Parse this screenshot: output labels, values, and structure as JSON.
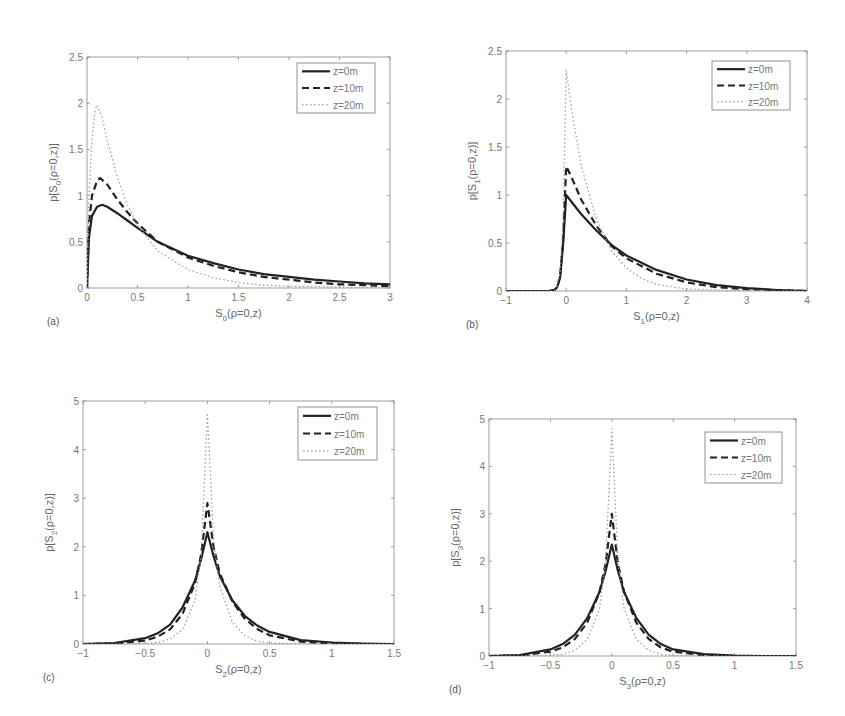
{
  "figure": {
    "legend_entries": [
      "z=0m",
      "z=10m",
      "z=20m"
    ]
  },
  "chart_data": [
    {
      "panel": "(a)",
      "type": "line",
      "xlabel": "S0(ρ=0,z)",
      "xlabel_main": "S",
      "xlabel_sub": "0",
      "xlabel_rest": "(ρ=0,z)",
      "ylabel": "p[S0(ρ=0,z)]",
      "ylabel_pre": "p[S",
      "ylabel_sub": "0",
      "ylabel_rest": "(ρ=0,z)]",
      "xlim": [
        0,
        3
      ],
      "ylim": [
        0,
        2.5
      ],
      "xticks": [
        "0",
        "0.5",
        "1",
        "1.5",
        "2",
        "2.5",
        "3"
      ],
      "xtick_values": [
        0,
        0.5,
        1,
        1.5,
        2,
        2.5,
        3
      ],
      "yticks": [
        "0",
        "0.5",
        "1",
        "1.5",
        "2",
        "2.5"
      ],
      "ytick_values": [
        0,
        0.5,
        1,
        1.5,
        2,
        2.5
      ],
      "legend_position": "upper right",
      "grid": false,
      "box": {
        "left": 87,
        "top": 57,
        "right": 390,
        "bottom": 288
      },
      "legend_box": {
        "left": 297,
        "top": 63,
        "right": 375,
        "bottom": 113
      },
      "series": [
        {
          "name": "z=0m",
          "style": "solid",
          "x": [
            0,
            0.02,
            0.05,
            0.1,
            0.15,
            0.2,
            0.3,
            0.4,
            0.5,
            0.7,
            1.0,
            1.25,
            1.5,
            1.75,
            2.0,
            2.25,
            2.5,
            2.75,
            3.0
          ],
          "y": [
            0,
            0.55,
            0.78,
            0.88,
            0.9,
            0.88,
            0.81,
            0.73,
            0.65,
            0.5,
            0.35,
            0.27,
            0.2,
            0.15,
            0.12,
            0.09,
            0.07,
            0.05,
            0.04
          ]
        },
        {
          "name": "z=10m",
          "style": "dashed",
          "x": [
            0,
            0.02,
            0.05,
            0.1,
            0.13,
            0.2,
            0.3,
            0.4,
            0.5,
            0.7,
            1.0,
            1.25,
            1.5,
            1.75,
            2.0,
            2.25,
            2.5,
            2.75,
            3.0
          ],
          "y": [
            0,
            0.7,
            1.0,
            1.16,
            1.19,
            1.12,
            0.96,
            0.82,
            0.7,
            0.5,
            0.33,
            0.24,
            0.17,
            0.12,
            0.09,
            0.06,
            0.04,
            0.03,
            0.02
          ]
        },
        {
          "name": "z=20m",
          "style": "dotted",
          "x": [
            0,
            0.02,
            0.05,
            0.08,
            0.1,
            0.15,
            0.2,
            0.3,
            0.4,
            0.5,
            0.7,
            1.0,
            1.25,
            1.5,
            1.75,
            2.0,
            2.5,
            3.0
          ],
          "y": [
            0,
            1.0,
            1.6,
            1.92,
            1.98,
            1.85,
            1.6,
            1.2,
            0.9,
            0.68,
            0.4,
            0.2,
            0.11,
            0.06,
            0.03,
            0.02,
            0.01,
            0.0
          ]
        }
      ]
    },
    {
      "panel": "(b)",
      "type": "line",
      "xlabel": "S1(ρ=0,z)",
      "xlabel_main": "S",
      "xlabel_sub": "1",
      "xlabel_rest": "(ρ=0,z)",
      "ylabel": "p[S1(ρ=0,z)]",
      "ylabel_pre": "p[S",
      "ylabel_sub": "1",
      "ylabel_rest": "(ρ=0,z)]",
      "xlim": [
        -1,
        4
      ],
      "ylim": [
        0,
        2.5
      ],
      "xticks": [
        "−1",
        "0",
        "1",
        "2",
        "3",
        "4"
      ],
      "xtick_values": [
        -1,
        0,
        1,
        2,
        3,
        4
      ],
      "yticks": [
        "0",
        "0.5",
        "1",
        "1.5",
        "2",
        "2.5"
      ],
      "ytick_values": [
        0,
        0.5,
        1,
        1.5,
        2,
        2.5
      ],
      "legend_position": "upper right",
      "grid": false,
      "box": {
        "left": 506,
        "top": 51,
        "right": 807,
        "bottom": 291
      },
      "legend_box": {
        "left": 712,
        "top": 61,
        "right": 790,
        "bottom": 110
      },
      "series": [
        {
          "name": "z=0m",
          "style": "solid",
          "x": [
            -1,
            -0.3,
            -0.2,
            -0.15,
            -0.1,
            -0.05,
            0,
            0.1,
            0.25,
            0.5,
            0.75,
            1.0,
            1.5,
            2.0,
            2.5,
            3.0,
            3.5,
            4.0
          ],
          "y": [
            0,
            0,
            0.01,
            0.04,
            0.15,
            0.5,
            1.0,
            0.92,
            0.8,
            0.63,
            0.48,
            0.37,
            0.22,
            0.12,
            0.06,
            0.03,
            0.01,
            0.0
          ]
        },
        {
          "name": "z=10m",
          "style": "dashed",
          "x": [
            -1,
            -0.3,
            -0.2,
            -0.15,
            -0.1,
            -0.05,
            0,
            0.1,
            0.25,
            0.5,
            0.75,
            1.0,
            1.5,
            2.0,
            2.5,
            3.0,
            3.5,
            4.0
          ],
          "y": [
            0,
            0,
            0.01,
            0.04,
            0.15,
            0.55,
            1.3,
            1.17,
            0.95,
            0.68,
            0.47,
            0.34,
            0.18,
            0.09,
            0.04,
            0.02,
            0.01,
            0.0
          ]
        },
        {
          "name": "z=20m",
          "style": "dotted",
          "x": [
            -1,
            -0.3,
            -0.2,
            -0.15,
            -0.1,
            -0.05,
            0,
            0.1,
            0.25,
            0.5,
            0.75,
            1.0,
            1.25,
            1.5,
            2.0,
            2.5,
            3.0,
            4.0
          ],
          "y": [
            0,
            0,
            0.01,
            0.05,
            0.2,
            0.8,
            2.3,
            1.85,
            1.3,
            0.75,
            0.42,
            0.24,
            0.13,
            0.07,
            0.02,
            0.01,
            0.0,
            0.0
          ]
        }
      ]
    },
    {
      "panel": "(c)",
      "type": "line",
      "xlabel": "S2(ρ=0,z)",
      "xlabel_main": "S",
      "xlabel_sub": "2",
      "xlabel_rest": "(ρ=0,z)",
      "ylabel": "p[S2(ρ=0,z)]",
      "ylabel_pre": "p[S",
      "ylabel_sub": "2",
      "ylabel_rest": "(ρ=0,z)]",
      "xlim": [
        -1,
        1.5
      ],
      "ylim": [
        0,
        5
      ],
      "xticks": [
        "−1",
        "−0.5",
        "0",
        "0.5",
        "1",
        "1.5"
      ],
      "xtick_values": [
        -1,
        -0.5,
        0,
        0.5,
        1,
        1.5
      ],
      "yticks": [
        "0",
        "1",
        "2",
        "3",
        "4",
        "5"
      ],
      "ytick_values": [
        0,
        1,
        2,
        3,
        4,
        5
      ],
      "legend_position": "upper right",
      "grid": false,
      "box": {
        "left": 83,
        "top": 401,
        "right": 394,
        "bottom": 644
      },
      "legend_box": {
        "left": 298,
        "top": 407,
        "right": 377,
        "bottom": 460
      },
      "series": [
        {
          "name": "z=0m",
          "style": "solid",
          "x": [
            -1,
            -0.75,
            -0.5,
            -0.4,
            -0.3,
            -0.2,
            -0.1,
            -0.05,
            0,
            0.05,
            0.1,
            0.2,
            0.3,
            0.4,
            0.5,
            0.75,
            1.0,
            1.25,
            1.5
          ],
          "y": [
            0.0,
            0.02,
            0.12,
            0.22,
            0.4,
            0.75,
            1.3,
            1.75,
            2.3,
            1.8,
            1.4,
            0.9,
            0.58,
            0.38,
            0.25,
            0.08,
            0.03,
            0.01,
            0.0
          ]
        },
        {
          "name": "z=10m",
          "style": "dashed",
          "x": [
            -1,
            -0.75,
            -0.5,
            -0.4,
            -0.3,
            -0.2,
            -0.1,
            -0.05,
            0,
            0.05,
            0.1,
            0.2,
            0.3,
            0.4,
            0.5,
            0.75,
            1.0,
            1.25,
            1.5
          ],
          "y": [
            0.0,
            0.01,
            0.07,
            0.15,
            0.3,
            0.62,
            1.25,
            1.85,
            2.9,
            2.0,
            1.45,
            0.88,
            0.52,
            0.31,
            0.18,
            0.05,
            0.01,
            0.0,
            0.0
          ]
        },
        {
          "name": "z=20m",
          "style": "dotted",
          "x": [
            -1,
            -0.75,
            -0.5,
            -0.4,
            -0.3,
            -0.2,
            -0.1,
            -0.05,
            0,
            0.05,
            0.1,
            0.2,
            0.3,
            0.4,
            0.5,
            0.75,
            1.0,
            1.5
          ],
          "y": [
            0.0,
            0.0,
            0.01,
            0.03,
            0.1,
            0.3,
            0.9,
            1.8,
            4.75,
            2.1,
            1.2,
            0.45,
            0.17,
            0.06,
            0.02,
            0.0,
            0.0,
            0.0
          ]
        }
      ]
    },
    {
      "panel": "(d)",
      "type": "line",
      "xlabel": "S3(ρ=0,z)",
      "xlabel_main": "S",
      "xlabel_sub": "3",
      "xlabel_rest": "(ρ=0,z)",
      "ylabel": "p[S3(ρ=0,z)]",
      "ylabel_pre": "p[S",
      "ylabel_sub": "3",
      "ylabel_rest": "(ρ=0,z)]",
      "xlim": [
        -1,
        1.5
      ],
      "ylim": [
        0,
        5
      ],
      "xticks": [
        "−1",
        "−0.5",
        "0",
        "0.5",
        "1",
        "1.5"
      ],
      "xtick_values": [
        -1,
        -0.5,
        0,
        0.5,
        1,
        1.5
      ],
      "yticks": [
        "0",
        "1",
        "2",
        "3",
        "4",
        "5"
      ],
      "ytick_values": [
        0,
        1,
        2,
        3,
        4,
        5
      ],
      "legend_position": "upper right",
      "grid": false,
      "box": {
        "left": 489,
        "top": 419,
        "right": 796,
        "bottom": 656
      },
      "legend_box": {
        "left": 705,
        "top": 432,
        "right": 782,
        "bottom": 483
      },
      "series": [
        {
          "name": "z=0m",
          "style": "solid",
          "x": [
            -1,
            -0.75,
            -0.5,
            -0.4,
            -0.3,
            -0.2,
            -0.1,
            -0.05,
            0,
            0.05,
            0.1,
            0.2,
            0.3,
            0.4,
            0.5,
            0.75,
            1.0,
            1.25,
            1.5
          ],
          "y": [
            0.0,
            0.02,
            0.14,
            0.25,
            0.45,
            0.8,
            1.35,
            1.8,
            2.35,
            1.8,
            1.35,
            0.8,
            0.45,
            0.25,
            0.14,
            0.04,
            0.01,
            0.0,
            0.0
          ]
        },
        {
          "name": "z=10m",
          "style": "dashed",
          "x": [
            -1,
            -0.75,
            -0.5,
            -0.4,
            -0.3,
            -0.2,
            -0.1,
            -0.05,
            0,
            0.05,
            0.1,
            0.2,
            0.3,
            0.4,
            0.5,
            0.75,
            1.0,
            1.25,
            1.5
          ],
          "y": [
            0.0,
            0.01,
            0.09,
            0.18,
            0.36,
            0.7,
            1.35,
            1.95,
            3.0,
            1.95,
            1.35,
            0.7,
            0.36,
            0.18,
            0.09,
            0.02,
            0.0,
            0.0,
            0.0
          ]
        },
        {
          "name": "z=20m",
          "style": "dotted",
          "x": [
            -1,
            -0.75,
            -0.5,
            -0.4,
            -0.3,
            -0.2,
            -0.1,
            -0.05,
            0,
            0.05,
            0.1,
            0.2,
            0.3,
            0.4,
            0.5,
            0.75,
            1.0,
            1.5
          ],
          "y": [
            0.0,
            0.0,
            0.01,
            0.04,
            0.12,
            0.35,
            1.0,
            2.0,
            4.8,
            2.0,
            1.0,
            0.35,
            0.12,
            0.04,
            0.01,
            0.0,
            0.0,
            0.0
          ]
        }
      ]
    }
  ]
}
